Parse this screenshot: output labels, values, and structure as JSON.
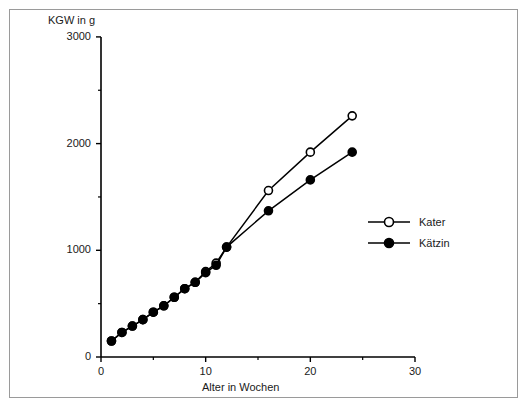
{
  "chart_data": {
    "type": "line",
    "title": "",
    "subtitle": "",
    "xlabel": "Alter in Wochen",
    "ylabel": "KGW in g",
    "xlim": [
      0,
      30
    ],
    "ylim": [
      0,
      3000
    ],
    "xticks": [
      0,
      10,
      20,
      30
    ],
    "yticks": [
      0,
      1000,
      2000,
      3000
    ],
    "xtick_labels": [
      "0",
      "10",
      "20",
      "30"
    ],
    "ytick_labels": [
      "0",
      "1000",
      "2000",
      "3000"
    ],
    "xminor_ticks": [
      5,
      15,
      25
    ],
    "yminor_ticks": [
      500,
      1500,
      2500
    ],
    "grid": false,
    "legend_position": "right-middle",
    "series": [
      {
        "name": "Kater",
        "marker": "open-circle",
        "x": [
          1,
          2,
          3,
          4,
          5,
          6,
          7,
          8,
          9,
          10,
          11,
          12,
          16,
          20,
          24
        ],
        "values": [
          150,
          230,
          290,
          350,
          420,
          480,
          560,
          640,
          700,
          800,
          880,
          1030,
          1560,
          1920,
          2260
        ]
      },
      {
        "name": "Kätzin",
        "marker": "filled-circle",
        "x": [
          1,
          2,
          3,
          4,
          5,
          6,
          7,
          8,
          9,
          10,
          11,
          12,
          16,
          20,
          24
        ],
        "values": [
          150,
          230,
          290,
          350,
          420,
          480,
          560,
          640,
          700,
          790,
          860,
          1030,
          1370,
          1660,
          1920
        ]
      }
    ]
  },
  "axis": {
    "y_title": "KGW in g",
    "x_title": "Alter in Wochen"
  },
  "legend": {
    "entries": [
      {
        "label": "Kater",
        "marker": "open-circle"
      },
      {
        "label": "Kätzin",
        "marker": "filled-circle"
      }
    ]
  }
}
